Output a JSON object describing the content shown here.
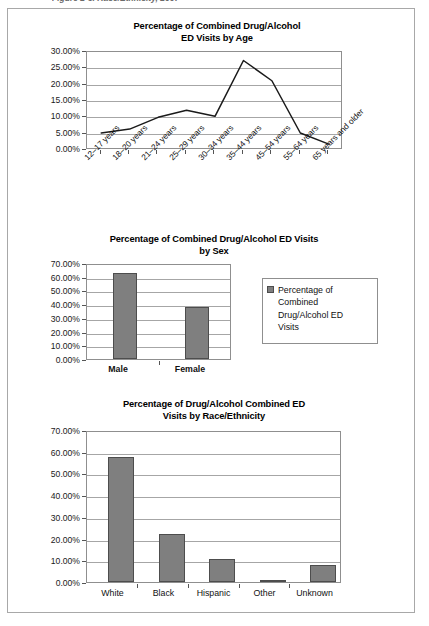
{
  "page": {
    "top_caption": "Figure 2-3.  Race/Ethnicity, 2007"
  },
  "charts": [
    {
      "id": "age-line-chart",
      "title_line1": "Percentage of Combined Drug/Alcohol",
      "title_line2": "ED Visits by Age",
      "chart_data": {
        "type": "line",
        "title": "Percentage of Combined Drug/Alcohol ED Visits by Age",
        "xlabel": "",
        "ylabel": "",
        "ylim": [
          0,
          30
        ],
        "yticks": [
          "0.00%",
          "5.00%",
          "10.00%",
          "15.00%",
          "20.00%",
          "25.00%",
          "30.00%"
        ],
        "grid": true,
        "legend": "none",
        "categories": [
          "12–17 years",
          "18–20 years",
          "21–24 years",
          "25–29 years",
          "30–34 years",
          "35–44 years",
          "45–54 years",
          "55–64 years",
          "65 years and older"
        ],
        "values": [
          5.2,
          6.4,
          10.0,
          12.2,
          10.3,
          27.4,
          21.2,
          5.2,
          1.8
        ],
        "series": [
          {
            "name": "Percentage of Combined Drug/Alcohol ED Visits",
            "values": [
              5.2,
              6.4,
              10.0,
              12.2,
              10.3,
              27.4,
              21.2,
              5.2,
              1.8
            ],
            "color": "#1a1a1a"
          }
        ]
      }
    },
    {
      "id": "sex-bar-chart",
      "title_line1": "Percentage of Combined Drug/Alcohol ED Visits",
      "title_line2": "by Sex",
      "legend": {
        "label_line1": "Percentage of",
        "label_line2": "Combined",
        "label_line3": "Drug/Alcohol ED",
        "label_line4": "Visits",
        "swatch_color": "#7f7f7f"
      },
      "chart_data": {
        "type": "bar",
        "title": "Percentage of Combined Drug/Alcohol ED Visits by Sex",
        "xlabel": "",
        "ylabel": "",
        "ylim": [
          0,
          70
        ],
        "yticks": [
          "0.00%",
          "10.00%",
          "20.00%",
          "30.00%",
          "40.00%",
          "50.00%",
          "60.00%",
          "70.00%"
        ],
        "grid": true,
        "legend_position": "right",
        "legend_entries": [
          "Percentage of Combined Drug/Alcohol ED Visits"
        ],
        "categories": [
          "Male",
          "Female"
        ],
        "values": [
          62.5,
          37.8
        ],
        "bar_color": "#7f7f7f"
      }
    },
    {
      "id": "race-ethnicity-bar-chart",
      "title_line1": "Percentage of Drug/Alcohol Combined ED",
      "title_line2": "Visits by Race/Ethnicity",
      "chart_data": {
        "type": "bar",
        "title": "Percentage of Drug/Alcohol Combined ED Visits by Race/Ethnicity",
        "xlabel": "",
        "ylabel": "",
        "ylim": [
          0,
          70
        ],
        "yticks": [
          "0.00%",
          "10.00%",
          "20.00%",
          "30.00%",
          "40.00%",
          "50.00%",
          "60.00%",
          "70.00%"
        ],
        "grid": true,
        "legend": "none",
        "categories": [
          "White",
          "Black",
          "Hispanic",
          "Other",
          "Unknown"
        ],
        "values": [
          57.5,
          22.3,
          10.7,
          1.0,
          8.0
        ],
        "bar_color": "#7f7f7f"
      }
    }
  ]
}
